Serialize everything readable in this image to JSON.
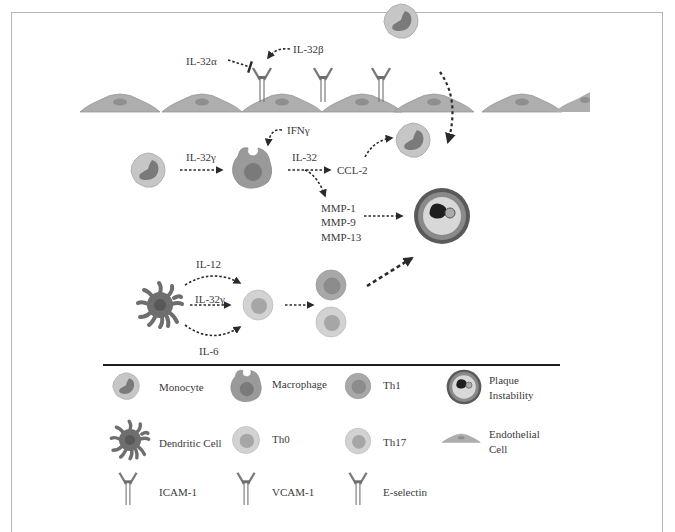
{
  "diagram": {
    "top_labels": {
      "il32a": "IL-32α",
      "il32b": "IL-32β",
      "ifng": "IFNγ",
      "il32g_mono": "IL-32γ",
      "il32": "IL-32",
      "ccl2": "CCL-2",
      "mmp1": "MMP-1",
      "mmp9": "MMP-9",
      "mmp13": "MMP-13",
      "il12": "IL-12",
      "il32g_dc": "IL-32γ",
      "il6": "IL-6"
    },
    "legend": [
      {
        "icon": "monocyte-icon",
        "label": "Monocyte"
      },
      {
        "icon": "macrophage-icon",
        "label": "Macrophage"
      },
      {
        "icon": "th1-cell-icon",
        "label": "Th1"
      },
      {
        "icon": "plaque-icon",
        "label_line1": "Plaque",
        "label_line2": "Instability"
      },
      {
        "icon": "dendritic-cell-icon",
        "label": "Dendritic Cell"
      },
      {
        "icon": "th0-cell-icon",
        "label": "Th0"
      },
      {
        "icon": "th17-cell-icon",
        "label": "Th17"
      },
      {
        "icon": "endothelial-cell-icon",
        "label_line1": "Endothelial",
        "label_line2": "Cell"
      },
      {
        "icon": "icam1-receptor-icon",
        "label": "ICAM-1"
      },
      {
        "icon": "vcam1-receptor-icon",
        "label": "VCAM-1"
      },
      {
        "icon": "e-selectin-receptor-icon",
        "label": "E-selectin"
      }
    ]
  },
  "colors": {
    "cell_fill": "#a9a9a9",
    "cell_outline": "#8f8f8f",
    "nucleus": "#8a8a8a",
    "monocyte_body": "#c4c4c4",
    "monocyte_nucleus": "#7c7c7c",
    "text": "#3a3a3a",
    "arrow": "#2a2a2a"
  }
}
